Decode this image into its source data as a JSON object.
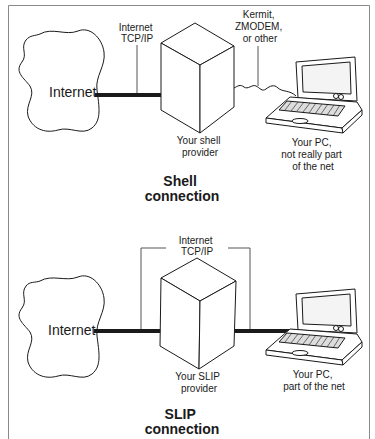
{
  "shell": {
    "internet_label": "Internet",
    "link_label": [
      "Internet",
      "TCP/IP"
    ],
    "protocol_label": [
      "Kermit,",
      "ZMODEM,",
      "or other"
    ],
    "provider_label": [
      "Your shell",
      "provider"
    ],
    "pc_label": [
      "Your PC,",
      "not really part",
      "of the net"
    ],
    "title": [
      "Shell",
      "connection"
    ]
  },
  "slip": {
    "internet_label": "Internet",
    "link_label": [
      "Internet",
      "TCP/IP"
    ],
    "provider_label": [
      "Your SLIP",
      "provider"
    ],
    "pc_label": [
      "Your PC,",
      "part of the net"
    ],
    "title": [
      "SLIP",
      "connection"
    ]
  },
  "colors": {
    "line": "#1a1a1a",
    "frame": "#8a8a8a",
    "thin": "#555555"
  }
}
